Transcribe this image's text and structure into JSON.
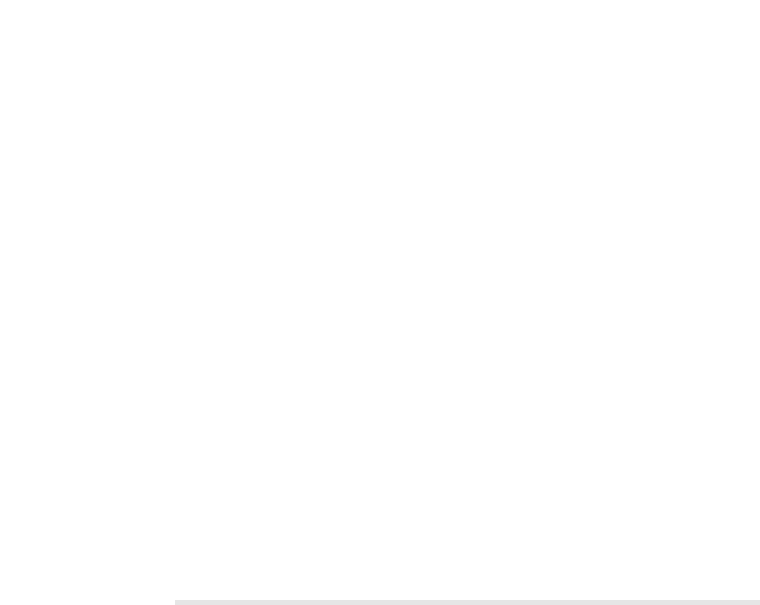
{
  "part_label": "(iii)",
  "chart_data": {
    "type": "scatter",
    "title": "",
    "xlabel": "h / m",
    "ylabel": "(E_max / mV)^2",
    "ylabel_parts": {
      "open": "(",
      "symbol": "E",
      "subscript": "max",
      "unit": " / mV)",
      "superscript": "2"
    },
    "xlim": [
      0,
      0.6
    ],
    "ylim": [
      0,
      60
    ],
    "x_ticks": [
      "0",
      "0.1",
      "0.2",
      "0.3",
      "0.4",
      "0.5",
      "0.6"
    ],
    "y_ticks": [
      "0",
      "10",
      "20",
      "30",
      "40",
      "50",
      "60"
    ],
    "grid": true,
    "legend": null,
    "series": [
      {
        "name": "data points",
        "x": [
          0.1,
          0.2,
          0.3,
          0.4,
          0.5,
          0.6
        ],
        "y": [
          6.7,
          18.0,
          27.2,
          37.6,
          48.0,
          58.7
        ],
        "error_upper": [
          8.8,
          19.8,
          29.2,
          39.6,
          49.6,
          60.2
        ],
        "error_lower": [
          5.0,
          16.2,
          25.6,
          35.6,
          46.4,
          57.4
        ]
      },
      {
        "name": "steepest line",
        "type": "line",
        "x": [
          0.057,
          0.6
        ],
        "y": [
          0,
          59.8
        ]
      },
      {
        "name": "shallowest line",
        "type": "line",
        "x": [
          0.015,
          0.6
        ],
        "y": [
          0,
          57.3
        ]
      }
    ]
  }
}
